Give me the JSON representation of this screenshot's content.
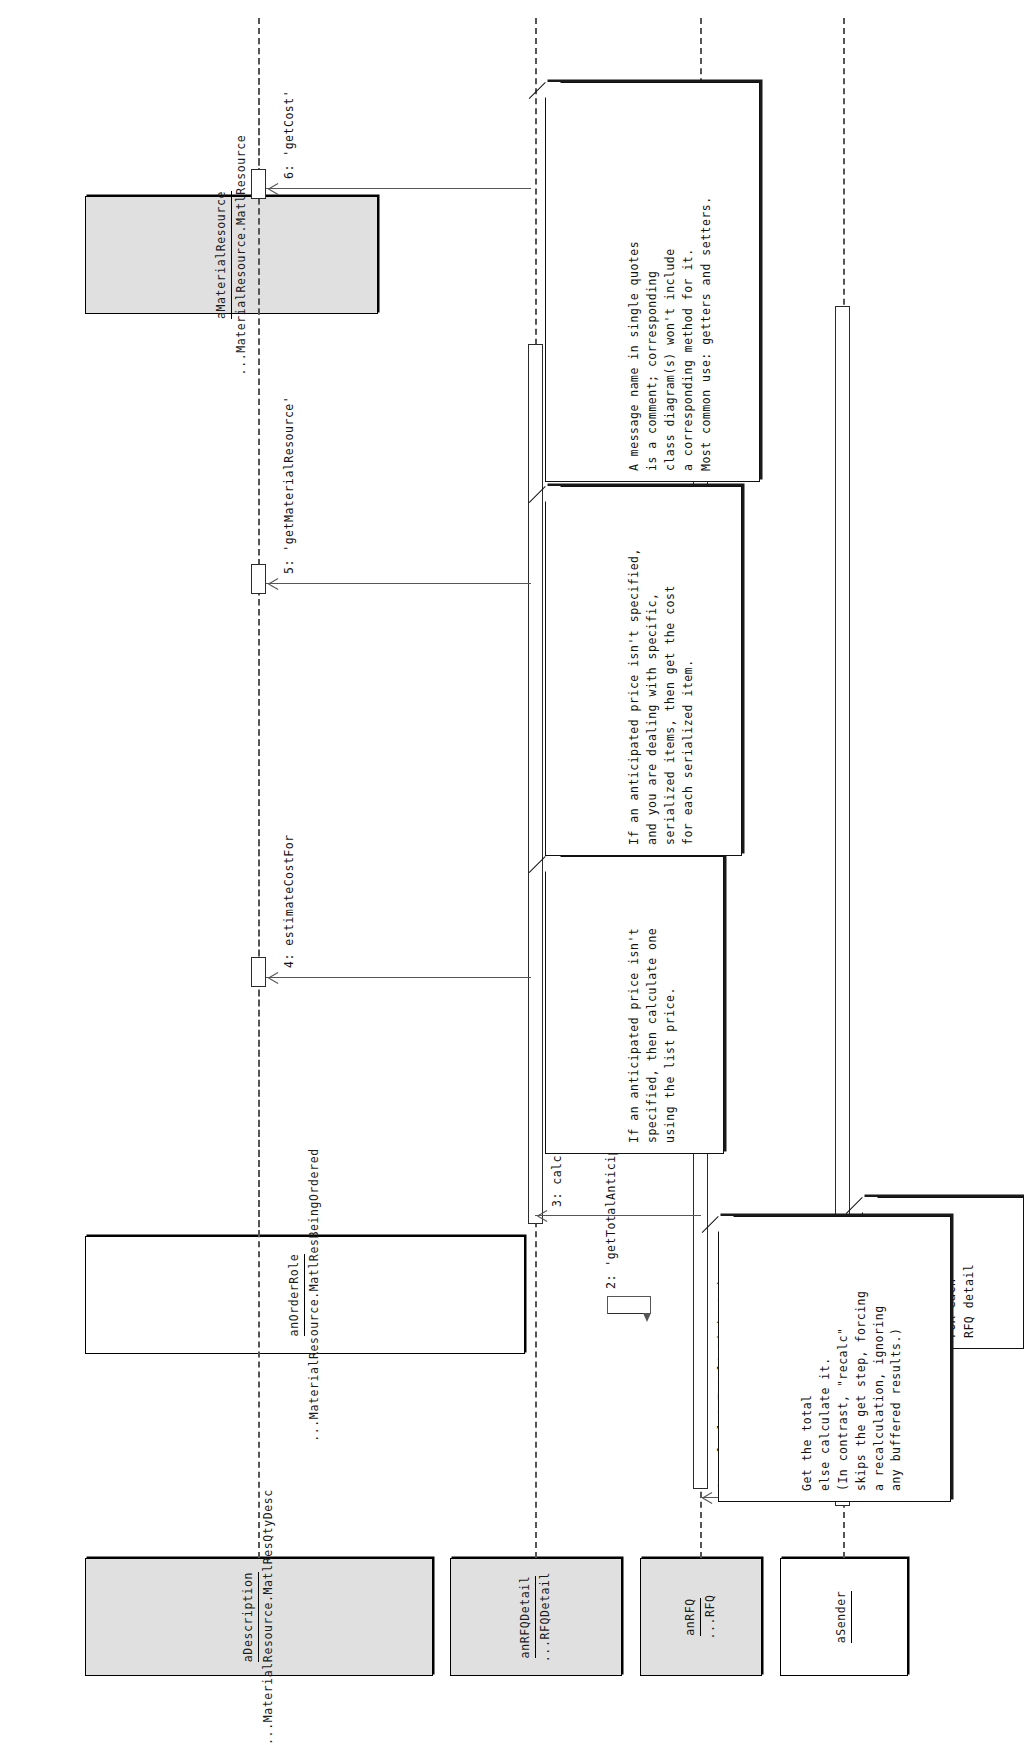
{
  "diagram": {
    "type": "uml-sequence-diagram",
    "orientation": "rotated-90-counterclockwise",
    "canvas": {
      "width": 947,
      "height": 1694
    }
  },
  "lifelines": [
    {
      "id": "sender",
      "name": "aSender",
      "class": "",
      "filled": false
    },
    {
      "id": "rfq",
      "name": "anRFQ",
      "class": "...RFQ",
      "filled": true
    },
    {
      "id": "rfqdetail",
      "name": "anRFQDetail",
      "class": "...RFQDetail",
      "filled": true
    },
    {
      "id": "description",
      "name": "aDescription",
      "class": "...MaterialResource.MatlResQtyDesc",
      "filled": true
    },
    {
      "id": "orderrole",
      "name": "anOrderRole",
      "class": "...MaterialResource.MatlResBeingOrdered",
      "filled": false
    },
    {
      "id": "materialres",
      "name": "aMaterialResource",
      "class": "...MaterialResource.MatlResource",
      "filled": true
    }
  ],
  "messages": [
    {
      "number": "1",
      "label": "1: calculateTotalAnticipated",
      "from": "sender",
      "to": "rfq"
    },
    {
      "number": "2",
      "label": "2: 'getTotalAnticipated'",
      "from": "rfqdetail",
      "to": "rfqdetail"
    },
    {
      "number": "3",
      "label": "3: calculateTotalAnticipated",
      "from": "rfq",
      "to": "rfqdetail"
    },
    {
      "number": "4",
      "label": "4: estimateCostFor",
      "from": "rfqdetail",
      "to": "description"
    },
    {
      "number": "5",
      "label": "5: 'getMaterialResource'",
      "from": "rfqdetail",
      "to": "orderrole"
    },
    {
      "number": "6",
      "label": "6: 'getCost'",
      "from": "rfqdetail",
      "to": "materialres"
    }
  ],
  "notes": [
    {
      "id": "note-loop",
      "text": "FOR each\nRFQ detail"
    },
    {
      "id": "note-get-total",
      "text": "Get the total\nelse calculate it.\n(In contrast, \"recalc\"\nskips the get step, forcing\na recalculation, ignoring\nany buffered results.)"
    },
    {
      "id": "note-anticipated-price",
      "text": "If an anticipated price isn't\nspecified, then calculate one\nusing the list price."
    },
    {
      "id": "note-serialized",
      "text": "If an anticipated price isn't specified,\nand you are dealing with specific,\nserialized items, then get the cost\nfor each serialized item."
    },
    {
      "id": "note-single-quotes",
      "text": "A message name in single quotes\nis a comment; corresponding\nclass diagram(s) won't include\na corresponding method for it.\nMost common use: getters and setters."
    }
  ],
  "colors": {
    "lifeline_fill": "#e0e0e0",
    "lifeline_plain": "#ffffff",
    "stroke": "#000000",
    "dashed_line": "#555555",
    "note_fill": "#ffffff",
    "page_background": "#ffffff"
  }
}
